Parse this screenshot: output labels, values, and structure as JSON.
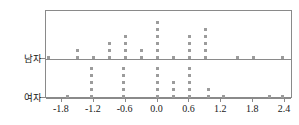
{
  "chart_data": {
    "type": "scatter",
    "title": "",
    "xlabel": "",
    "ylabel": "",
    "grid": false,
    "legend_position": "none",
    "xlim": [
      -2.1,
      2.55
    ],
    "xticks": [
      -1.8,
      -1.2,
      -0.6,
      0.0,
      0.6,
      1.2,
      1.8,
      2.4
    ],
    "xticklabels": [
      "-1.8",
      "-1.2",
      "-0.6",
      "0.0",
      "0.6",
      "1.2",
      "1.8",
      "2.4"
    ],
    "categories": [
      "남자",
      "여자"
    ],
    "marker": "square",
    "marker_color": "#9c9c9c",
    "series": [
      {
        "name": "남자",
        "stacks": [
          {
            "x": -2.05,
            "count": 1
          },
          {
            "x": -1.5,
            "count": 2
          },
          {
            "x": -1.2,
            "count": 1
          },
          {
            "x": -0.9,
            "count": 3
          },
          {
            "x": -0.6,
            "count": 4
          },
          {
            "x": -0.3,
            "count": 2
          },
          {
            "x": 0.0,
            "count": 6
          },
          {
            "x": 0.3,
            "count": 1
          },
          {
            "x": 0.6,
            "count": 4
          },
          {
            "x": 0.9,
            "count": 5
          },
          {
            "x": 1.5,
            "count": 1
          },
          {
            "x": 1.8,
            "count": 1
          },
          {
            "x": 2.35,
            "count": 1
          }
        ]
      },
      {
        "name": "여자",
        "stacks": [
          {
            "x": -1.7,
            "count": 1
          },
          {
            "x": -1.25,
            "count": 5
          },
          {
            "x": -0.65,
            "count": 5
          },
          {
            "x": 0.0,
            "count": 5
          },
          {
            "x": 0.3,
            "count": 3
          },
          {
            "x": 0.6,
            "count": 5
          },
          {
            "x": 0.95,
            "count": 2
          },
          {
            "x": 1.25,
            "count": 1
          },
          {
            "x": 2.1,
            "count": 1
          },
          {
            "x": 2.35,
            "count": 1
          }
        ]
      }
    ]
  },
  "axis": {
    "y_categories": [
      {
        "label": "남자"
      },
      {
        "label": "여자"
      }
    ]
  }
}
